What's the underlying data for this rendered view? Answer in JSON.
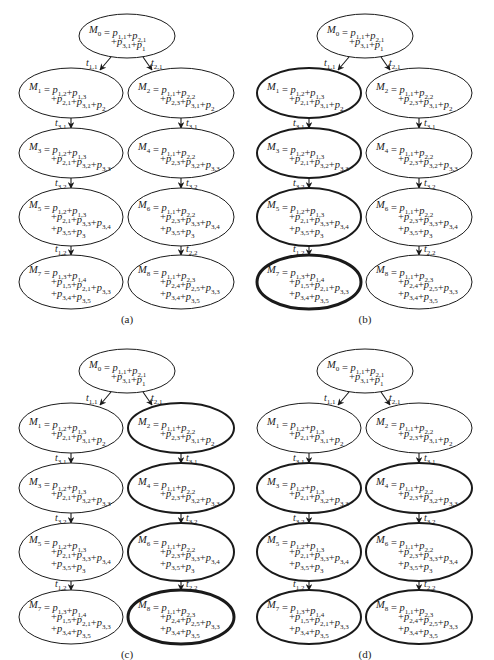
{
  "figure": {
    "panels": [
      {
        "id": "a",
        "caption": "(a)",
        "ox": 0,
        "oy": 0,
        "highlight": []
      },
      {
        "id": "b",
        "caption": "(b)",
        "ox": 238,
        "oy": 0,
        "highlight": [
          "M1",
          "M3",
          "M5",
          "M7"
        ],
        "extra_bold": [
          "M7"
        ]
      },
      {
        "id": "c",
        "caption": "(c)",
        "ox": 0,
        "oy": 335,
        "highlight": [
          "M2",
          "M4",
          "M6",
          "M8"
        ],
        "extra_bold": [
          "M8"
        ]
      },
      {
        "id": "d",
        "caption": "(d)",
        "ox": 238,
        "oy": 335,
        "highlight": [
          "M3",
          "M4",
          "M5",
          "M6",
          "M7",
          "M8"
        ],
        "extra_bold": []
      }
    ],
    "nodes": [
      {
        "id": "M0",
        "cx": 127,
        "cy": 36,
        "rx": 48,
        "ry": 22,
        "lines": [
          [
            [
              "M",
              "0"
            ],
            "=",
            [
              "p",
              "1,1"
            ],
            "+",
            [
              "p",
              "2,1"
            ]
          ],
          [
            "+",
            [
              "p",
              "3,1"
            ],
            "+",
            [
              "p",
              "1"
            ]
          ]
        ]
      },
      {
        "id": "M1",
        "cx": 71,
        "cy": 93,
        "rx": 52,
        "ry": 25,
        "lines": [
          [
            [
              "M",
              "1"
            ],
            "=",
            [
              "p",
              "1,2"
            ],
            "+",
            [
              "p",
              "1,3"
            ]
          ],
          [
            "+",
            [
              "p",
              "2,1"
            ],
            "+",
            [
              "p",
              "3,1"
            ],
            "+",
            [
              "p",
              "2"
            ]
          ]
        ]
      },
      {
        "id": "M2",
        "cx": 181,
        "cy": 93,
        "rx": 53,
        "ry": 25,
        "lines": [
          [
            [
              "M",
              "2"
            ],
            "=",
            [
              "p",
              "1,1"
            ],
            "+",
            [
              "p",
              "2,2"
            ]
          ],
          [
            "+",
            [
              "p",
              "2,3"
            ],
            "+",
            [
              "p",
              "3,1"
            ],
            "+",
            [
              "p",
              "2"
            ]
          ]
        ]
      },
      {
        "id": "M3",
        "cx": 71,
        "cy": 153,
        "rx": 52,
        "ry": 25,
        "lines": [
          [
            [
              "M",
              "3"
            ],
            "=",
            [
              "p",
              "1,2"
            ],
            "+",
            [
              "p",
              "1,3"
            ]
          ],
          [
            "+",
            [
              "p",
              "2,1"
            ],
            "+",
            [
              "p",
              "3,2"
            ],
            "+",
            [
              "p",
              "3,3"
            ]
          ]
        ]
      },
      {
        "id": "M4",
        "cx": 181,
        "cy": 153,
        "rx": 53,
        "ry": 25,
        "lines": [
          [
            [
              "M",
              "4"
            ],
            "=",
            [
              "p",
              "1,1"
            ],
            "+",
            [
              "p",
              "2,2"
            ]
          ],
          [
            "+",
            [
              "p",
              "2,3"
            ],
            "+",
            [
              "p",
              "3,2"
            ],
            "+",
            [
              "p",
              "3,3"
            ]
          ]
        ]
      },
      {
        "id": "M5",
        "cx": 71,
        "cy": 217,
        "rx": 52,
        "ry": 29,
        "lines": [
          [
            [
              "M",
              "5"
            ],
            "=",
            [
              "p",
              "1,2"
            ],
            "+",
            [
              "p",
              "1,3"
            ]
          ],
          [
            "+",
            [
              "p",
              "2,1"
            ],
            "+",
            [
              "p",
              "3,3"
            ],
            "+",
            [
              "p",
              "3,4"
            ]
          ],
          [
            "+",
            [
              "p",
              "3,5"
            ],
            "+",
            [
              "p",
              "3"
            ]
          ]
        ]
      },
      {
        "id": "M6",
        "cx": 181,
        "cy": 217,
        "rx": 53,
        "ry": 29,
        "lines": [
          [
            [
              "M",
              "6"
            ],
            "=",
            [
              "p",
              "1,1"
            ],
            "+",
            [
              "p",
              "2,2"
            ]
          ],
          [
            "+",
            [
              "p",
              "2,3"
            ],
            "+",
            [
              "p",
              "3,3"
            ],
            "+",
            [
              "p",
              "3,4"
            ]
          ],
          [
            "+",
            [
              "p",
              "3,5"
            ],
            "+",
            [
              "p",
              "3"
            ]
          ]
        ]
      },
      {
        "id": "M7",
        "cx": 71,
        "cy": 282,
        "rx": 52,
        "ry": 27,
        "lines": [
          [
            [
              "M",
              "7"
            ],
            "=",
            [
              "p",
              "1,3"
            ],
            "+",
            [
              "p",
              "1,4"
            ]
          ],
          [
            "+",
            [
              "p",
              "1,5"
            ],
            "+",
            [
              "p",
              "2,1"
            ],
            "+",
            [
              "p",
              "3,3"
            ]
          ],
          [
            "+",
            [
              "p",
              "3,4"
            ],
            "+",
            [
              "p",
              "3,5"
            ]
          ]
        ]
      },
      {
        "id": "M8",
        "cx": 181,
        "cy": 282,
        "rx": 53,
        "ry": 27,
        "lines": [
          [
            [
              "M",
              "8"
            ],
            "=",
            [
              "p",
              "1,1"
            ],
            "+",
            [
              "p",
              "2,3"
            ]
          ],
          [
            "+",
            [
              "p",
              "2,4"
            ],
            "+",
            [
              "p",
              "2,5"
            ],
            "+",
            [
              "p",
              "3,3"
            ]
          ],
          [
            "+",
            [
              "p",
              "3,4"
            ],
            "+",
            [
              "p",
              "3,5"
            ]
          ]
        ]
      }
    ],
    "edges": [
      {
        "from": "M0",
        "to": "M1",
        "label": "1,1",
        "x1": 111,
        "y1": 57,
        "x2": 100,
        "y2": 70,
        "lx": 86,
        "ly": 66
      },
      {
        "from": "M0",
        "to": "M2",
        "label": "2,1",
        "x1": 143,
        "y1": 57,
        "x2": 152,
        "y2": 70,
        "lx": 151,
        "ly": 66
      },
      {
        "from": "M1",
        "to": "M3",
        "label": "3,1",
        "x1": 71,
        "y1": 118,
        "x2": 71,
        "y2": 128,
        "lx": 55,
        "ly": 126
      },
      {
        "from": "M2",
        "to": "M4",
        "label": "3,1",
        "x1": 181,
        "y1": 118,
        "x2": 181,
        "y2": 128,
        "lx": 186,
        "ly": 126
      },
      {
        "from": "M3",
        "to": "M5",
        "label": "3,2",
        "x1": 71,
        "y1": 178,
        "x2": 71,
        "y2": 188,
        "lx": 55,
        "ly": 186
      },
      {
        "from": "M4",
        "to": "M6",
        "label": "3,2",
        "x1": 181,
        "y1": 178,
        "x2": 181,
        "y2": 188,
        "lx": 186,
        "ly": 186
      },
      {
        "from": "M5",
        "to": "M7",
        "label": "1,2",
        "x1": 71,
        "y1": 246,
        "x2": 71,
        "y2": 255,
        "lx": 55,
        "ly": 252
      },
      {
        "from": "M6",
        "to": "M8",
        "label": "2,2",
        "x1": 181,
        "y1": 246,
        "x2": 181,
        "y2": 255,
        "lx": 186,
        "ly": 252
      }
    ],
    "caption_y": 323,
    "caption_x": 127,
    "stroke_normal": 1.0,
    "stroke_highlight": 2.0,
    "stroke_extra": 3.0,
    "color": "#1a1a1a"
  }
}
